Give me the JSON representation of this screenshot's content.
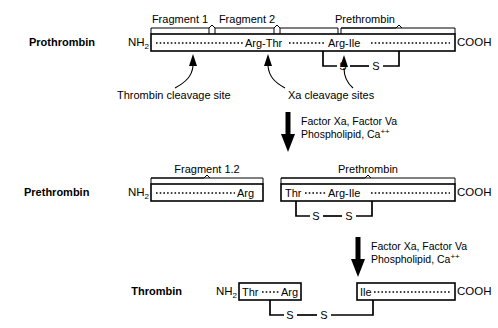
{
  "diagram": {
    "rows": [
      {
        "name": "prothrombin-row",
        "label": "Prothrombin",
        "n_terminus": "NH",
        "n_terminus_sub": "2",
        "c_terminus": "COOH",
        "brackets": [
          {
            "label": "Fragment 1"
          },
          {
            "label": "Fragment 2"
          },
          {
            "label": "Prethrombin"
          }
        ],
        "sequence_marks": [
          "Arg-Thr",
          "Arg-Ile"
        ],
        "disulfide": [
          "S",
          "S"
        ]
      },
      {
        "name": "prethrombin-row",
        "label": "Prethrombin",
        "n_terminus": "NH",
        "n_terminus_sub": "2",
        "c_terminus": "COOH",
        "brackets": [
          {
            "label": "Fragment 1.2"
          },
          {
            "label": "Prethrombin"
          }
        ],
        "left_box_end": "Arg",
        "right_box_start": "Thr",
        "sequence_marks": [
          "Arg-Ile"
        ],
        "disulfide": [
          "S",
          "S"
        ]
      },
      {
        "name": "thrombin-row",
        "label": "Thrombin",
        "n_terminus": "NH",
        "n_terminus_sub": "2",
        "c_terminus": "COOH",
        "left_box_start": "Thr",
        "left_box_end": "Arg",
        "right_box_start": "Ile",
        "disulfide": [
          "S",
          "S"
        ]
      }
    ],
    "annotations": [
      {
        "name": "thrombin-cleavage-note",
        "text": "Thrombin cleavage site"
      },
      {
        "name": "xa-cleavage-note",
        "text": "Xa cleavage sites"
      }
    ],
    "conditions": [
      {
        "name": "condition-1",
        "line1": "Factor Xa, Factor Va",
        "line2_main": "Phospholipid, Ca",
        "line2_sup": "++"
      },
      {
        "name": "condition-2",
        "line1": "Factor Xa, Factor Va",
        "line2_main": "Phospholipid, Ca",
        "line2_sup": "++"
      }
    ],
    "colors": {
      "ink": "#000000",
      "paper": "#ffffff"
    }
  }
}
